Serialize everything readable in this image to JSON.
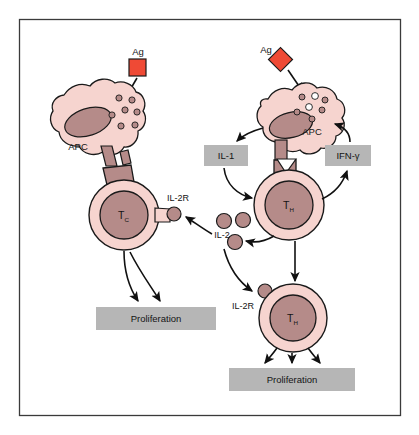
{
  "figure": {
    "frame_color": "#3a3a3a",
    "background": "#ffffff"
  },
  "palette": {
    "cell_cytoplasm": "#f6d4cf",
    "cell_nucleus": "#b58b89",
    "cell_outline": "#1a1a1a",
    "antigen_red": "#ef4a35",
    "box_gray": "#b6b6b6",
    "arrow_black": "#111111",
    "receptor_fill": "#b58b89"
  },
  "antigens": [
    {
      "id": "ag-left",
      "label": "Ag",
      "shape": "square",
      "x": 137,
      "y": 66,
      "size": 17,
      "rotation": 0
    },
    {
      "id": "ag-right",
      "label": "Ag",
      "shape": "diamond",
      "x": 281,
      "y": 60,
      "size": 17,
      "rotation": 45
    }
  ],
  "cells": [
    {
      "id": "apc-left",
      "label": "APC",
      "type": "antigen-presenting-cell",
      "label_x": 78,
      "label_y": 148
    },
    {
      "id": "tc",
      "label": "T",
      "sublabel": "C",
      "type": "cytotoxic-t-cell",
      "label_x": 124,
      "label_y": 215
    },
    {
      "id": "apc-right",
      "label": "APC",
      "type": "antigen-presenting-cell",
      "label_x": 311,
      "label_y": 133
    },
    {
      "id": "th-upper",
      "label": "T",
      "sublabel": "H",
      "type": "helper-t-cell",
      "label_x": 289,
      "label_y": 205
    },
    {
      "id": "th-lower",
      "label": "T",
      "sublabel": "H",
      "type": "helper-t-cell",
      "label_x": 291,
      "label_y": 318
    }
  ],
  "receptors": [
    {
      "id": "il2r-tc",
      "label": "IL-2R",
      "label_x": 178,
      "label_y": 202
    },
    {
      "id": "il2r-th-lower",
      "label": "IL-2R",
      "label_x": 242,
      "label_y": 308
    }
  ],
  "cytokines": [
    {
      "id": "il1",
      "label": "IL-1",
      "style": "gray-box",
      "x": 204,
      "y": 145,
      "w": 44,
      "h": 21
    },
    {
      "id": "ifn-gamma",
      "label": "IFN-γ",
      "style": "gray-box",
      "x": 325,
      "y": 145,
      "w": 46,
      "h": 21
    },
    {
      "id": "il2",
      "label": "IL-2",
      "style": "free-molecules",
      "label_x": 225,
      "label_y": 237,
      "molecule_count": 3
    }
  ],
  "outcomes": [
    {
      "id": "proliferation-left",
      "label": "Proliferation",
      "x": 96,
      "y": 307,
      "w": 120,
      "h": 23
    },
    {
      "id": "proliferation-right",
      "label": "Proliferation",
      "x": 229,
      "y": 368,
      "w": 126,
      "h": 23
    }
  ],
  "arrow_annotations": {
    "ag_left_to_apc": "Antigen uptake by APC",
    "ag_right_to_apc": "Antigen uptake by APC",
    "apc_to_il1": "APC secretes IL-1",
    "il1_to_th": "IL-1 stimulates TH",
    "th_to_ifn": "TH secretes IFN-gamma",
    "ifn_to_apc": "IFN-gamma activates APC",
    "th_to_il2": "TH secretes IL-2",
    "il2_to_tc": "IL-2 binds IL-2R on TC",
    "il2_to_th_lower": "IL-2 binds IL-2R on TH",
    "tc_to_proliferation": "TC proliferation",
    "th_to_proliferation": "TH proliferation"
  }
}
